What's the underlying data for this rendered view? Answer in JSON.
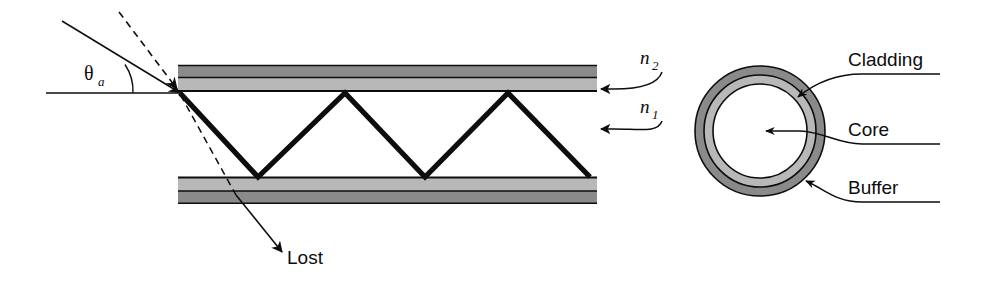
{
  "figure": {
    "background": "#ffffff",
    "width": 986,
    "height": 282
  },
  "colors": {
    "ink": "#0d0d0d",
    "cladding_dark": "#8a8a8a",
    "cladding_light": "#b8b8b8",
    "core_white": "#ffffff",
    "ring_outer": "#8a8a8a",
    "ring_middle": "#b8b8b8"
  },
  "labels": {
    "theta": "θ",
    "theta_sub": "a",
    "n2": "n",
    "n2_sub": "2",
    "n1": "n",
    "n1_sub": "1",
    "lost": "Lost",
    "cladding": "Cladding",
    "core": "Core",
    "buffer": "Buffer"
  },
  "icons": {
    "arrow_n2": "arrow-left-icon",
    "arrow_n1": "arrow-left-icon",
    "arrow_lost": "arrow-down-right-icon",
    "arrow_cladding": "leader-arrow-icon",
    "arrow_core": "leader-arrow-icon",
    "arrow_buffer": "leader-arrow-icon",
    "ray_incident_solid": "ray-line-icon",
    "ray_incident_dashed": "dashed-ray-icon"
  },
  "geometry": {
    "fiber": {
      "x_start": 178,
      "x_end": 597,
      "upper_cladding_top": 65,
      "upper_cladding_bottom": 91,
      "lower_cladding_top": 176,
      "lower_cladding_bottom": 204,
      "axis_y": 93
    },
    "zigzag_points": "180,93 258,177 345,93 425,177 508,93 590,177",
    "cross_section": {
      "cx": 760,
      "cy": 131,
      "r_outer": 65,
      "r_mid": 56,
      "r_core": 47
    }
  }
}
